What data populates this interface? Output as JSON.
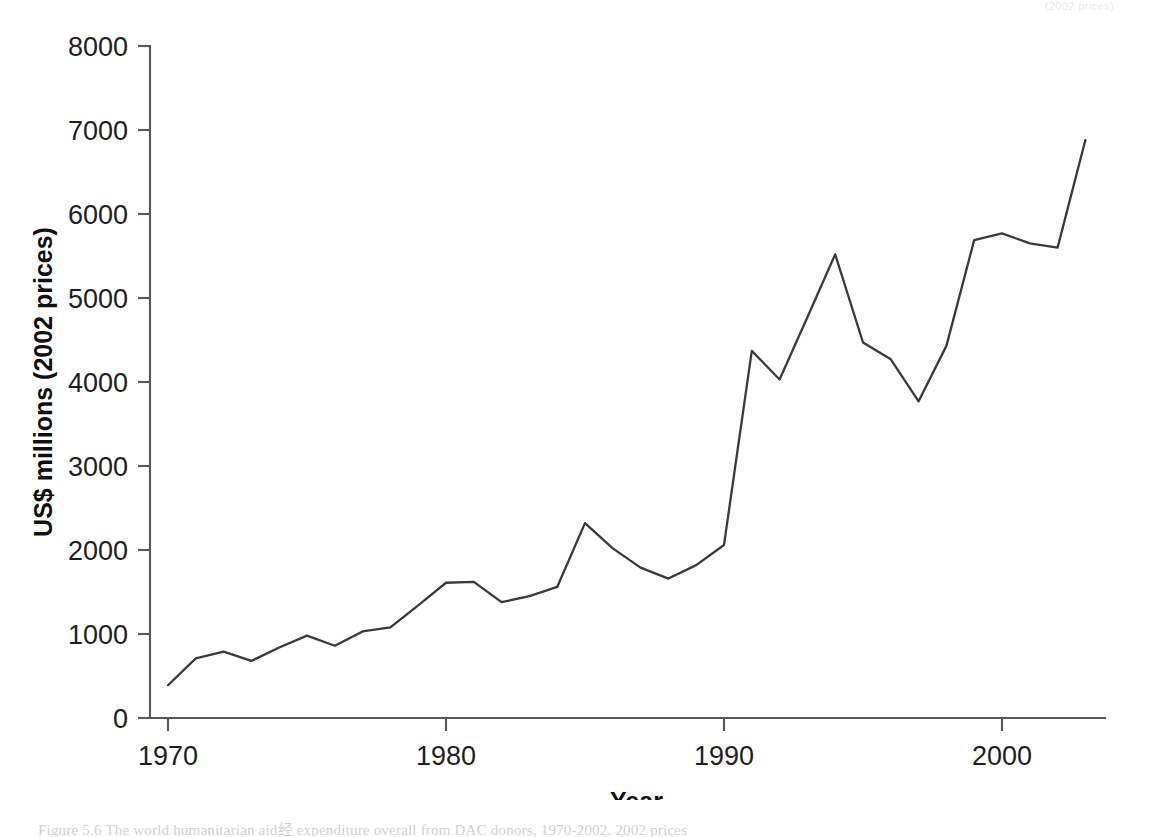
{
  "figure": {
    "top_bleed_text": "(2002 prices)",
    "caption": "Figure 5.6 The world humanitarian aid经 expenditure overall from DAC donors, 1970-2002, 2002 prices"
  },
  "chart_data": {
    "type": "line",
    "title": "",
    "xlabel": "Year",
    "ylabel": "US$ millions (2002 prices)",
    "xlim": [
      1969,
      2003.5
    ],
    "ylim": [
      0,
      8000
    ],
    "grid": false,
    "legend": null,
    "x_ticks": [
      1970,
      1980,
      1990,
      2000
    ],
    "x_tick_labels": [
      "1970",
      "1980",
      "1990",
      "2000"
    ],
    "y_ticks": [
      0,
      1000,
      2000,
      3000,
      4000,
      5000,
      6000,
      7000,
      8000
    ],
    "y_tick_labels": [
      "0",
      "1000",
      "2000",
      "3000",
      "4000",
      "5000",
      "6000",
      "7000",
      "8000"
    ],
    "x": [
      1970,
      1971,
      1972,
      1973,
      1974,
      1975,
      1976,
      1977,
      1978,
      1979,
      1980,
      1981,
      1982,
      1983,
      1984,
      1985,
      1986,
      1987,
      1988,
      1989,
      1990,
      1991,
      1992,
      1993,
      1994,
      1995,
      1996,
      1997,
      1998,
      1999,
      2000,
      2001,
      2002,
      2003
    ],
    "values": [
      390,
      710,
      790,
      680,
      840,
      980,
      860,
      1030,
      1080,
      1340,
      1610,
      1620,
      1380,
      1450,
      1560,
      2320,
      2020,
      1790,
      1660,
      1820,
      2060,
      4370,
      4030,
      4770,
      5520,
      4470,
      4270,
      3770,
      4430,
      5690,
      5770,
      5650,
      5600,
      6880
    ],
    "series": [
      {
        "name": "Humanitarian aid expenditure",
        "values": [
          390,
          710,
          790,
          680,
          840,
          980,
          860,
          1030,
          1080,
          1340,
          1610,
          1620,
          1380,
          1450,
          1560,
          2320,
          2020,
          1790,
          1660,
          1820,
          2060,
          4370,
          4030,
          4770,
          5520,
          4470,
          4270,
          3770,
          4430,
          5690,
          5770,
          5650,
          5600,
          6880
        ],
        "color": "#3a3a3e"
      }
    ]
  },
  "colors": {
    "line": "#3a3a3e",
    "axis": "#58585c",
    "text": "#1f1f22",
    "background": "#ffffff"
  }
}
